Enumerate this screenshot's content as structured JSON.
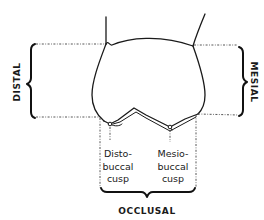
{
  "diagram": {
    "labels": {
      "distal": "DISTAL",
      "mesial": "MESIAL",
      "occlusal": "OCCLUSAL",
      "distobuccal_cusp": [
        "Disto-",
        "buccal",
        "cusp"
      ],
      "mesiobuccal_cusp": [
        "Mesio-",
        "buccal",
        "cusp"
      ]
    },
    "colors": {
      "line": "#1a1a1a",
      "dotted": "#444444",
      "background": "#ffffff"
    }
  }
}
